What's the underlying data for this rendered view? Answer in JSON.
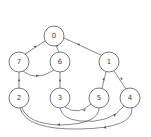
{
  "diagram": {
    "type": "directed-graph",
    "nodes": [
      {
        "id": "0",
        "label": "0",
        "x": 54,
        "y": 36
      },
      {
        "id": "7",
        "label": "7",
        "x": 19,
        "y": 62
      },
      {
        "id": "6",
        "label": "6",
        "x": 60,
        "y": 62
      },
      {
        "id": "1",
        "label": "1",
        "x": 109,
        "y": 62
      },
      {
        "id": "2",
        "label": "2",
        "x": 19,
        "y": 98
      },
      {
        "id": "3",
        "label": "3",
        "x": 60,
        "y": 98
      },
      {
        "id": "5",
        "label": "5",
        "x": 99,
        "y": 98
      },
      {
        "id": "4",
        "label": "4",
        "x": 130,
        "y": 98
      }
    ],
    "node_radius": 10,
    "edges": [
      {
        "from": "7",
        "to": "0"
      },
      {
        "from": "6",
        "to": "0"
      },
      {
        "from": "1",
        "to": "0"
      },
      {
        "from": "7",
        "to": "6"
      },
      {
        "from": "2",
        "to": "7"
      },
      {
        "from": "3",
        "to": "6"
      },
      {
        "from": "5",
        "to": "1"
      },
      {
        "from": "4",
        "to": "1"
      },
      {
        "from": "3",
        "to": "5"
      },
      {
        "from": "4",
        "to": "3"
      },
      {
        "from": "5",
        "to": "2"
      },
      {
        "from": "4",
        "to": "2"
      }
    ],
    "colors": {
      "stroke": "#555555",
      "fill": "#ffffff",
      "label": "#444444"
    }
  }
}
